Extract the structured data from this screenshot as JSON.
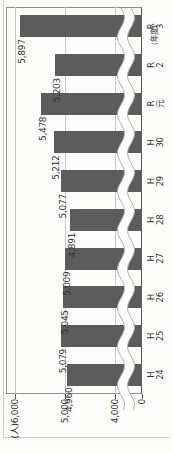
{
  "chart_data": {
    "type": "bar",
    "title": "",
    "categories": [
      "H24",
      "H25",
      "H26",
      "H27",
      "H28",
      "H29",
      "H30",
      "R元",
      "R2",
      "R3"
    ],
    "category_lines": [
      [
        "H",
        "24"
      ],
      [
        "H",
        "25"
      ],
      [
        "H",
        "26"
      ],
      [
        "H",
        "27"
      ],
      [
        "H",
        "28"
      ],
      [
        "H",
        "29"
      ],
      [
        "H",
        "30"
      ],
      [
        "R",
        "元"
      ],
      [
        "R",
        "2"
      ],
      [
        "R",
        "3"
      ]
    ],
    "values": [
      4960,
      5079,
      5045,
      5009,
      4891,
      5077,
      5212,
      5478,
      5203,
      5897
    ],
    "value_labels": [
      "4,960",
      "5,079",
      "5,045",
      "5,009",
      "4,891",
      "5,077",
      "5,212",
      "5,478",
      "5,203",
      "5,897"
    ],
    "xlabel": "(年度)",
    "ylabel": "(人)",
    "y_ticks": [
      {
        "value": 6000,
        "label": "(人)6,000"
      },
      {
        "value": 5000,
        "label": "5,000"
      },
      {
        "value": 4000,
        "label": "4,000"
      },
      {
        "value": 0,
        "label": "0"
      }
    ],
    "ylim": [
      4000,
      6000
    ],
    "axis_break": {
      "between": [
        0,
        4000
      ],
      "style": "wavy"
    },
    "grid": "horizontal",
    "legend": "none",
    "layout_note": "vertical bar chart displayed rotated 90 degrees counter-clockwise on the page"
  },
  "colors": {
    "bar": "#5c5c5c",
    "grid": "#c9c9c9",
    "frame": "#8f8f8f",
    "axis": "#555555",
    "text": "#333333",
    "wave_stroke": "#b3b3b3",
    "wave_fill": "#ffffff",
    "background": "#fdfdfc",
    "artifact_line": "#cccccc"
  }
}
